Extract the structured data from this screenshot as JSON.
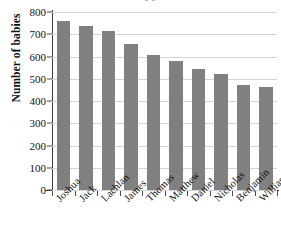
{
  "chart_data": {
    "type": "bar",
    "title": "",
    "xlabel": "",
    "ylabel": "Number of babies",
    "ylim": [
      0,
      800
    ],
    "ytick_step": 100,
    "yticks": [
      800,
      700,
      600,
      500,
      400,
      300,
      200,
      100,
      0
    ],
    "grid": true,
    "legend": "none",
    "bar_color": "#808080",
    "categories": [
      "Joshua",
      "Jack",
      "Lachlan",
      "James",
      "Thomas",
      "Matthew",
      "Daniel",
      "Nicholas",
      "Benjamin",
      "William"
    ],
    "values": [
      760,
      737,
      715,
      657,
      607,
      580,
      543,
      520,
      470,
      462
    ]
  },
  "axes": {
    "y_title": "Number of babies",
    "y_tick_labels": [
      "800",
      "700",
      "600",
      "500",
      "400",
      "300",
      "200",
      "100",
      "0"
    ],
    "x_tick_labels": [
      "Joshua",
      "Jack",
      "Lachlan",
      "James",
      "Thomas",
      "Matthew",
      "Daniel",
      "Nicholas",
      "Benjamin",
      "William"
    ]
  },
  "title_remnant": "• •"
}
